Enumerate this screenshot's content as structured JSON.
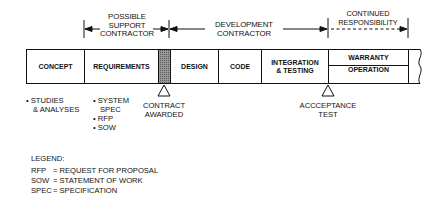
{
  "responsibility": {
    "possible_support": [
      "POSSIBLE",
      "SUPPORT",
      "CONTRACTOR"
    ],
    "development": [
      "DEVELOPMENT",
      "CONTRACTOR"
    ],
    "continued": [
      "CONTINUED",
      "RESPONSIBILITY"
    ]
  },
  "phases": [
    {
      "label": "CONCEPT"
    },
    {
      "label": "REQUIREMENTS"
    },
    {
      "label": ""
    },
    {
      "label": "DESIGN"
    },
    {
      "label": "CODE"
    },
    {
      "label": "INTEGRATION",
      "label2": "& TESTING"
    },
    {
      "label": "WARRANTY",
      "label2": "OPERATION"
    }
  ],
  "notes": {
    "concept": [
      "• STUDIES",
      "& ANALYSES"
    ],
    "requirements": [
      "• SYSTEM",
      "SPEC",
      "• RFP",
      "• SOW"
    ]
  },
  "milestones": {
    "contract_awarded": [
      "CONTRACT",
      "AWARDED"
    ],
    "acceptance_test": [
      "ACCCEPTANCE",
      "TEST"
    ]
  },
  "legend": {
    "title": "LEGEND:",
    "items": [
      {
        "abbr": "RFP",
        "def": "= REQUEST FOR PROPOSAL"
      },
      {
        "abbr": "SOW",
        "def": "= STATEMENT OF WORK"
      },
      {
        "abbr": "SPEC",
        "def": "= SPECIFICATION"
      }
    ]
  }
}
